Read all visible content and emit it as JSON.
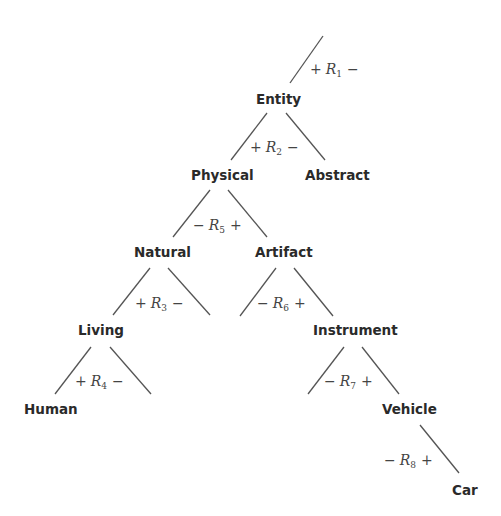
{
  "diagram": {
    "type": "taxonomy-tree",
    "colors": {
      "background": "#ffffff",
      "node_text": "#2a2a2a",
      "edge": "#555555",
      "relation_text": "#444444"
    },
    "nodes": {
      "entity": "Entity",
      "physical": "Physical",
      "abstract": "Abstract",
      "natural": "Natural",
      "artifact": "Artifact",
      "living": "Living",
      "instrument": "Instrument",
      "human": "Human",
      "vehicle": "Vehicle",
      "car": "Car"
    },
    "relations": {
      "r1": {
        "left": "+",
        "name": "R",
        "sub": "1",
        "right": "−"
      },
      "r2": {
        "left": "+",
        "name": "R",
        "sub": "2",
        "right": "−"
      },
      "r5": {
        "left": "−",
        "name": "R",
        "sub": "5",
        "right": "+"
      },
      "r3": {
        "left": "+",
        "name": "R",
        "sub": "3",
        "right": "−"
      },
      "r6": {
        "left": "−",
        "name": "R",
        "sub": "6",
        "right": "+"
      },
      "r4": {
        "left": "+",
        "name": "R",
        "sub": "4",
        "right": "−"
      },
      "r7": {
        "left": "−",
        "name": "R",
        "sub": "7",
        "right": "+"
      },
      "r8": {
        "left": "−",
        "name": "R",
        "sub": "8",
        "right": "+"
      }
    },
    "edges": [
      {
        "from": "root",
        "to": "Entity",
        "relation": "R1"
      },
      {
        "from": "Entity",
        "to": "Physical",
        "relation": "R2"
      },
      {
        "from": "Entity",
        "to": "Abstract",
        "relation": "R2"
      },
      {
        "from": "Physical",
        "to": "Natural",
        "relation": "R5"
      },
      {
        "from": "Physical",
        "to": "Artifact",
        "relation": "R5"
      },
      {
        "from": "Natural",
        "to": "Living",
        "relation": "R3"
      },
      {
        "from": "Natural",
        "to": "(unlabeled)",
        "relation": "R3"
      },
      {
        "from": "Artifact",
        "to": "(unlabeled)",
        "relation": "R6"
      },
      {
        "from": "Artifact",
        "to": "Instrument",
        "relation": "R6"
      },
      {
        "from": "Living",
        "to": "Human",
        "relation": "R4"
      },
      {
        "from": "Living",
        "to": "(unlabeled)",
        "relation": "R4"
      },
      {
        "from": "Instrument",
        "to": "(unlabeled)",
        "relation": "R7"
      },
      {
        "from": "Instrument",
        "to": "Vehicle",
        "relation": "R7"
      },
      {
        "from": "Vehicle",
        "to": "Car",
        "relation": "R8"
      }
    ]
  }
}
